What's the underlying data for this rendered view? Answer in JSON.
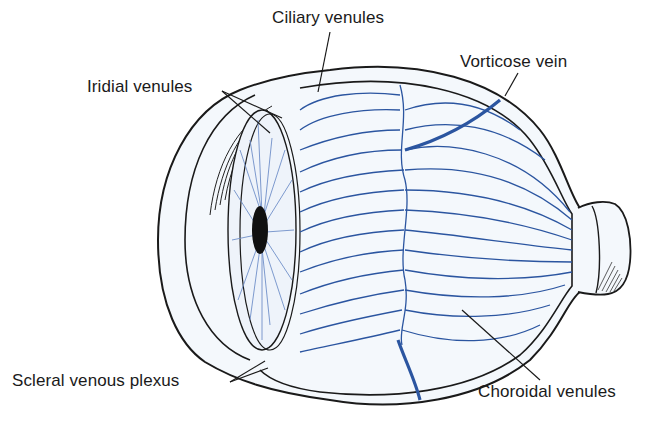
{
  "diagram": {
    "labels": {
      "ciliary_venules": "Ciliary venules",
      "iridial_venules": "Iridial venules",
      "vorticose_vein": "Vorticose vein",
      "scleral_venous_plexus": "Scleral venous plexus",
      "choroidal_venules": "Choroidal venules"
    },
    "colors": {
      "vessel_blue": "#2b55a0",
      "vessel_light": "#6f8fc8",
      "outline": "#1a1a1a",
      "sclera_fill": "#f4f8fc",
      "iris_fill": "#eef3fa",
      "pupil": "#111111",
      "background": "#ffffff"
    }
  }
}
